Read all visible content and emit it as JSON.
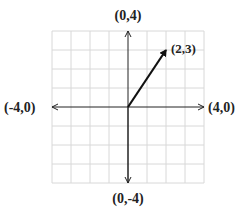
{
  "diagram": {
    "type": "vector-on-grid",
    "grid": {
      "xmin": -4,
      "xmax": 4,
      "ymin": -4,
      "ymax": 4,
      "step": 1
    },
    "labels": {
      "top": "(0,4)",
      "bottom": "(0,-4)",
      "left": "(-4,0)",
      "right": "(4,0)",
      "vector_tip": "(2,3)"
    },
    "vector": {
      "from": [
        0,
        0
      ],
      "to": [
        2,
        3
      ]
    },
    "colors": {
      "grid": "#d8d8d8",
      "axis": "#222222",
      "vector": "#111111"
    }
  }
}
